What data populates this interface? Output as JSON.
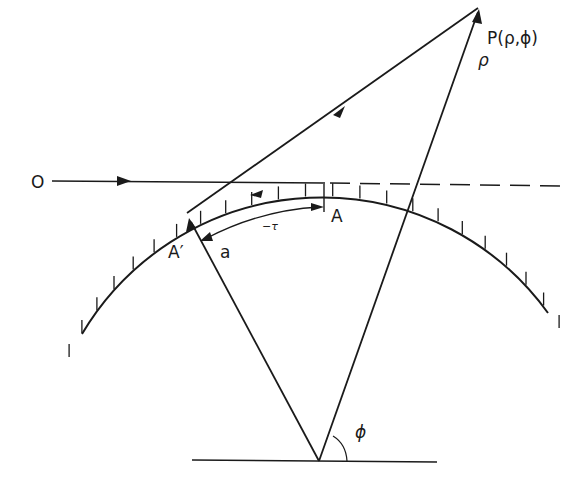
{
  "diagram": {
    "type": "geometric-construction",
    "stroke_color": "#1a1a1a",
    "background": "#ffffff",
    "circle": {
      "cx": 322,
      "cy": 462,
      "r": 279,
      "start_deg": 196,
      "end_deg": 332,
      "hatch": "inner-ticks"
    },
    "labels": {
      "origin": "O",
      "point": "P(ρ,ϕ)",
      "rho": "ρ",
      "point_A": "A",
      "point_A_prime": "A′",
      "radius_a": "a",
      "tau": "−τ",
      "phi": "ϕ"
    },
    "elements": [
      "incident ray from O (horizontal, arrow rightward)",
      "dashed continuation of horizontal ray beyond A",
      "creeping-wave arc from A to A′ along circle (arrow)",
      "tangent ray from A′ to P (arrow)",
      "radius a from center to A′ (arrow)",
      "line from center to P with ρ label (arrow)",
      "arc arrow −τ from A to A′",
      "base line with angle ϕ"
    ]
  }
}
